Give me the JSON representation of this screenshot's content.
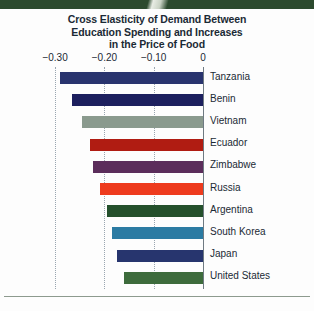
{
  "banner": {
    "color": "#2c4a2e"
  },
  "title": {
    "line1": "Cross Elasticity of Demand Between",
    "line2": "Education Spending and Increases",
    "line3": "in the Price of Food"
  },
  "axis": {
    "tick_labels": [
      "−0.30",
      "−0.20",
      "−0.10",
      "0"
    ],
    "tick_values": [
      -0.3,
      -0.2,
      -0.1,
      0
    ]
  },
  "chart_data": {
    "type": "bar",
    "orientation": "horizontal",
    "title": "Cross Elasticity of Demand Between Education Spending and Increases in the Price of Food",
    "xlabel": "",
    "ylabel": "",
    "xlim": [
      -0.32,
      0
    ],
    "grid": true,
    "legend": "none",
    "categories": [
      "Tanzania",
      "Benin",
      "Vietnam",
      "Ecuador",
      "Zimbabwe",
      "Russia",
      "Argentina",
      "South Korea",
      "Japan",
      "United States"
    ],
    "values": [
      -0.29,
      -0.265,
      -0.245,
      -0.23,
      -0.223,
      -0.209,
      -0.195,
      -0.185,
      -0.175,
      -0.16
    ],
    "colors": [
      "#29346e",
      "#1c1f5e",
      "#8a9a8e",
      "#b01c12",
      "#5b2d5b",
      "#ee3b1e",
      "#24502c",
      "#2b7ba3",
      "#27356e",
      "#3d6b3c"
    ],
    "bars": [
      {
        "label": "Tanzania",
        "value": -0.29,
        "color": "#29346e"
      },
      {
        "label": "Benin",
        "value": -0.265,
        "color": "#1c1f5e"
      },
      {
        "label": "Vietnam",
        "value": -0.245,
        "color": "#8a9a8e"
      },
      {
        "label": "Ecuador",
        "value": -0.23,
        "color": "#b01c12"
      },
      {
        "label": "Zimbabwe",
        "value": -0.223,
        "color": "#5b2d5b"
      },
      {
        "label": "Russia",
        "value": -0.209,
        "color": "#ee3b1e"
      },
      {
        "label": "Argentina",
        "value": -0.195,
        "color": "#24502c"
      },
      {
        "label": "South Korea",
        "value": -0.185,
        "color": "#2b7ba3"
      },
      {
        "label": "Japan",
        "value": -0.175,
        "color": "#27356e"
      },
      {
        "label": "United States",
        "value": -0.16,
        "color": "#3d6b3c"
      }
    ]
  }
}
